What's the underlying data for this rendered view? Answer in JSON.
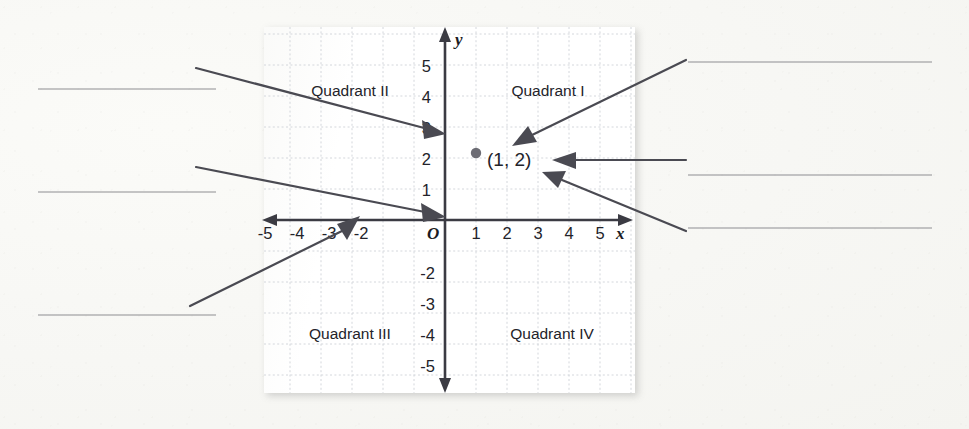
{
  "page": {
    "background_color": "#f7f7f4"
  },
  "graph": {
    "axis_labels": {
      "x": "x",
      "y": "y",
      "origin": "O"
    },
    "x_ticks": [
      "-5",
      "-4",
      "-3",
      "-2",
      "1",
      "2",
      "3",
      "4",
      "5"
    ],
    "y_ticks": [
      "5",
      "4",
      "3",
      "2",
      "1",
      "-2",
      "-3",
      "-4",
      "-5"
    ],
    "quadrants": [
      {
        "name": "quadrant-1",
        "label": "Quadrant I"
      },
      {
        "name": "quadrant-2",
        "label": "Quadrant II"
      },
      {
        "name": "quadrant-3",
        "label": "Quadrant III"
      },
      {
        "name": "quadrant-4",
        "label": "Quadrant IV"
      }
    ],
    "point": {
      "label": "(1, 2)",
      "x": 1,
      "y": 2,
      "color": "#6c6c74"
    },
    "grid_color": "#cfd3d8",
    "axis_color": "#3b3b43"
  },
  "answer_lines": {
    "left": [
      {
        "name": "answer-line-left-1",
        "value": ""
      },
      {
        "name": "answer-line-left-2",
        "value": ""
      },
      {
        "name": "answer-line-left-3",
        "value": ""
      }
    ],
    "right": [
      {
        "name": "answer-line-right-1",
        "value": ""
      },
      {
        "name": "answer-line-right-2",
        "value": ""
      },
      {
        "name": "answer-line-right-3",
        "value": ""
      }
    ]
  },
  "callouts": [
    {
      "name": "callout-left-top",
      "points_to": "y-axis"
    },
    {
      "name": "callout-left-middle",
      "points_to": "origin"
    },
    {
      "name": "callout-left-bottom",
      "points_to": "x-axis"
    },
    {
      "name": "callout-right-top",
      "points_to": "point-(1,2)"
    },
    {
      "name": "callout-right-middle",
      "points_to": "point-label"
    },
    {
      "name": "callout-right-bottom",
      "points_to": "point-label"
    }
  ]
}
